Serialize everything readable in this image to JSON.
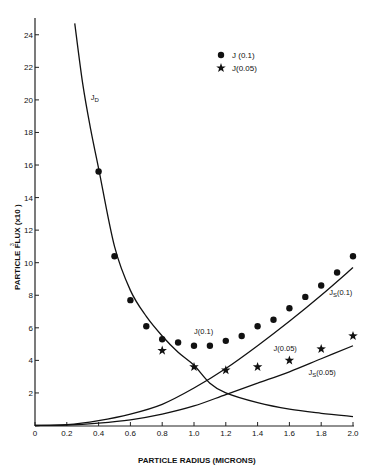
{
  "chart_data": {
    "type": "line",
    "title": "",
    "xlabel": "PARTICLE RADIUS (MICRONS)",
    "ylabel": "PARTICLE FLUX (x10  )",
    "xlim": [
      0,
      2.0
    ],
    "ylim": [
      0,
      25
    ],
    "grid": false,
    "legend_position": "top-right",
    "x_ticks": [
      "0",
      "0.2",
      "0.4",
      "0.6",
      "0.8",
      "1.0",
      "1.2",
      "1.4",
      "1.6",
      "1.8",
      "2.0"
    ],
    "y_ticks": [
      "2",
      "4",
      "6",
      "8",
      "10",
      "12",
      "14",
      "16",
      "18",
      "20",
      "22",
      "24"
    ],
    "legend": [
      {
        "marker": "circle",
        "label": "J (0.1)"
      },
      {
        "marker": "star",
        "label": "J(0.05)"
      }
    ],
    "series": [
      {
        "name": "J (0.1)",
        "kind": "scatter",
        "marker": "circle",
        "x": [
          0.4,
          0.5,
          0.6,
          0.7,
          0.8,
          0.9,
          1.0,
          1.1,
          1.2,
          1.3,
          1.4,
          1.5,
          1.6,
          1.7,
          1.8,
          1.9,
          2.0
        ],
        "y": [
          15.6,
          10.4,
          7.7,
          6.1,
          5.3,
          5.1,
          4.9,
          4.9,
          5.2,
          5.5,
          6.1,
          6.5,
          7.2,
          7.9,
          8.6,
          9.4,
          10.4
        ]
      },
      {
        "name": "J(0.05)",
        "kind": "scatter",
        "marker": "star",
        "x": [
          0.8,
          1.0,
          1.2,
          1.4,
          1.6,
          1.8,
          2.0
        ],
        "y": [
          4.6,
          3.6,
          3.4,
          3.6,
          4.0,
          4.7,
          5.5
        ]
      },
      {
        "name": "JD",
        "kind": "line",
        "x": [
          0.25,
          0.3,
          0.35,
          0.4,
          0.5,
          0.6,
          0.7,
          0.8,
          0.9,
          1.0,
          1.1,
          1.2,
          1.4,
          1.6,
          1.8,
          2.0
        ],
        "y": [
          24.7,
          21.0,
          18.2,
          15.8,
          11.0,
          8.3,
          6.7,
          5.5,
          4.5,
          3.7,
          2.6,
          2.0,
          1.4,
          1.0,
          0.75,
          0.55
        ]
      },
      {
        "name": "Js(0.1)",
        "kind": "line",
        "x": [
          0,
          0.2,
          0.4,
          0.6,
          0.8,
          1.0,
          1.2,
          1.4,
          1.6,
          1.8,
          2.0
        ],
        "y": [
          0,
          0.05,
          0.3,
          0.7,
          1.3,
          2.3,
          3.5,
          4.9,
          6.4,
          8.0,
          9.7
        ]
      },
      {
        "name": "Js(0.05)",
        "kind": "line",
        "x": [
          0,
          0.2,
          0.4,
          0.6,
          0.8,
          1.0,
          1.2,
          1.4,
          1.6,
          1.8,
          2.0
        ],
        "y": [
          0,
          0.03,
          0.15,
          0.35,
          0.7,
          1.2,
          1.9,
          2.6,
          3.3,
          4.1,
          4.9
        ]
      }
    ],
    "annotations": [
      {
        "text": "JD",
        "x": 0.35,
        "y": 20.0
      },
      {
        "text": "J(0.1)",
        "x": 1.0,
        "y": 5.6
      },
      {
        "text": "Js(0.1)",
        "x": 1.85,
        "y": 8.0
      },
      {
        "text": "J(0.05)",
        "x": 1.5,
        "y": 4.6
      },
      {
        "text": "Js(0.05)",
        "x": 1.72,
        "y": 3.1
      }
    ]
  }
}
